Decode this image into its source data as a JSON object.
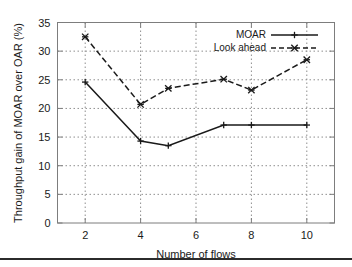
{
  "chart_data": {
    "type": "line",
    "title": "",
    "xlabel": "Number of flows",
    "ylabel": "Throughput gain of MOAR over OAR (%)",
    "xlim": [
      1,
      11
    ],
    "ylim": [
      0,
      35
    ],
    "xticks": [
      "2",
      "4",
      "6",
      "8",
      "10"
    ],
    "xtick_values": [
      2,
      4,
      6,
      8,
      10
    ],
    "yticks": [
      "0",
      "5",
      "10",
      "15",
      "20",
      "25",
      "30",
      "35"
    ],
    "ytick_values": [
      0,
      5,
      10,
      15,
      20,
      25,
      30,
      35
    ],
    "grid": true,
    "legend_position": "top-right",
    "x": [
      2,
      4,
      5,
      7,
      8,
      10
    ],
    "series": [
      {
        "name": "MOAR",
        "style": "solid",
        "marker": "plus",
        "color": "#1a1a1a",
        "values": [
          24.6,
          14.3,
          13.5,
          17.1,
          17.1,
          17.1
        ]
      },
      {
        "name": "Look ahead",
        "style": "dashed",
        "marker": "cross",
        "color": "#1a1a1a",
        "values": [
          32.5,
          20.7,
          23.5,
          25.1,
          23.2,
          28.5
        ]
      }
    ]
  },
  "legend": {
    "entries": [
      {
        "label": "MOAR"
      },
      {
        "label": "Look ahead"
      }
    ]
  },
  "axis_labels": {
    "x": "Number of flows",
    "y": "Throughput gain of MOAR over OAR (%)"
  },
  "colors": {
    "line": "#1a1a1a",
    "grid": "#8f8f8f",
    "frame": "#7d7d7d",
    "background": "#ffffff",
    "rule": "#2b2b2b"
  }
}
